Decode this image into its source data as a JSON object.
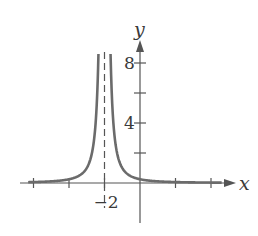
{
  "chart_data": {
    "type": "line",
    "title": "",
    "function": "y = 1/(x+2)^2",
    "xlabel": "x",
    "ylabel": "y",
    "xlim": [
      -6.3,
      7.5
    ],
    "ylim": [
      -2.6,
      9.6
    ],
    "x_ticks": [
      -6,
      -4,
      -2,
      0,
      2,
      4
    ],
    "x_tick_labels": [
      {
        "value": -2,
        "label": "−2"
      }
    ],
    "y_ticks": [
      2,
      4,
      6,
      8
    ],
    "y_tick_labels": [
      {
        "value": 4,
        "label": "4"
      },
      {
        "value": 8,
        "label": "8"
      }
    ],
    "vertical_asymptote": {
      "x": -2,
      "style": "dashed"
    },
    "horizontal_asymptote": {
      "y": 0
    },
    "series": [
      {
        "name": "f(x)",
        "x": [
          -6,
          -5,
          -4,
          -3,
          -2.5,
          -2.35,
          -1.65,
          -1.5,
          -1,
          0,
          2,
          4,
          6
        ],
        "values": [
          0.0625,
          0.111,
          0.25,
          1,
          4,
          8.16,
          8.16,
          4,
          1,
          0.25,
          0.0625,
          0.028,
          0.016
        ]
      }
    ],
    "grid": false,
    "legend": null
  },
  "axes": {
    "x_label": "x",
    "y_label": "y"
  },
  "colors": {
    "curve": "#6b6b6b",
    "axis": "#555555",
    "text": "#3a3a3a"
  }
}
